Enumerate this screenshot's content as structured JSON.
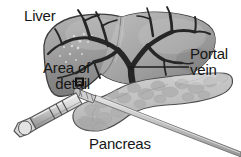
{
  "figure": {
    "background_color": "#ffffff",
    "width": 241,
    "height": 157
  },
  "labels": {
    "liver": "Liver",
    "area_of_detail_line1": "Area of",
    "area_of_detail_line2": "detail",
    "portal_vein_line1": "Portal",
    "portal_vein_line2": "vein",
    "pancreas": "Pancreas"
  },
  "annotations": {
    "detail_marker": "square-outline-marker",
    "portal_vein_leader": "horizontal-leader-line"
  },
  "anatomy": {
    "liver": {
      "name": "liver",
      "fill_light": "#b9b9b9",
      "fill_mid": "#9a9a9a",
      "fill_dark": "#7d7d7d",
      "outline": "#3a3a3a"
    },
    "portal_vein": {
      "name": "portal-vein-tree",
      "color": "#262626"
    },
    "pancreas": {
      "name": "pancreas",
      "fill": "#c9c9c9",
      "lobule": "#aeaeae",
      "outline": "#4a4a4a"
    }
  },
  "instrument": {
    "syringe": {
      "name": "biopsy-syringe",
      "barrel_fill": "#d5d5d5",
      "barrel_shade": "#9d9d9d",
      "outline": "#555555"
    },
    "needle": {
      "name": "biopsy-needle",
      "fill": "#c4c4c4",
      "outline": "#6b6b6b"
    }
  },
  "colors": {
    "text": "#161616",
    "leader_line": "#1d1d1d",
    "marker_outline": "#111111"
  }
}
